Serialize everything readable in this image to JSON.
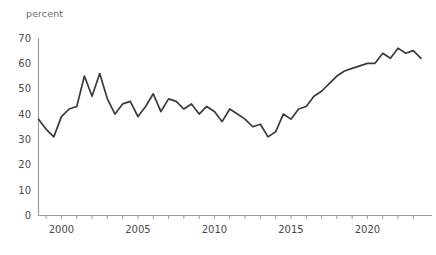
{
  "chart_data": {
    "type": "line",
    "title": "",
    "subtitle": "",
    "xlabel": "",
    "ylabel": "percent",
    "unit_label": "percent",
    "xlim": [
      1998.5,
      1998.5
    ],
    "ylim": [
      0,
      70
    ],
    "grid": false,
    "legend": false,
    "legend_position": "none",
    "line_color": "#3b3b3b",
    "axis_color": "#9a9a9a",
    "tick_label_color": "#4a4a4a",
    "unit_label_color": "#6e6e6e",
    "yticks": [
      0,
      10,
      20,
      30,
      40,
      50,
      60,
      70
    ],
    "ytick_labels": [
      "0",
      "10",
      "20",
      "30",
      "40",
      "50",
      "60",
      "70"
    ],
    "xticks": [
      1999,
      2000,
      2001,
      2002,
      2003,
      2004,
      2005,
      2006,
      2007,
      2008,
      2009,
      2010,
      2011,
      2012,
      2013,
      2014,
      2015,
      2016,
      2017,
      2018,
      2019,
      2020,
      2021,
      2022,
      2023
    ],
    "xtick_labels_shown": [
      "2000",
      "2005",
      "2010",
      "2015",
      "2020"
    ],
    "xtick_labels_shown_at": [
      2000,
      2005,
      2010,
      2015,
      2020
    ],
    "series": [
      {
        "name": "percent",
        "x": [
          1998.5,
          1999.0,
          1999.5,
          2000.0,
          2000.5,
          2001.0,
          2001.5,
          2002.0,
          2002.5,
          2003.0,
          2003.5,
          2004.0,
          2004.5,
          2005.0,
          2005.5,
          2006.0,
          2006.5,
          2007.0,
          2007.5,
          2008.0,
          2008.5,
          2009.0,
          2009.5,
          2010.0,
          2010.5,
          2011.0,
          2011.5,
          2012.0,
          2012.5,
          2013.0,
          2013.5,
          2014.0,
          2014.5,
          2015.0,
          2015.5,
          2016.0,
          2016.5,
          2017.0,
          2017.5,
          2018.0,
          2018.5,
          2019.0,
          2019.5,
          2020.0,
          2020.5,
          2021.0,
          2021.5,
          2022.0,
          2022.5,
          2023.0,
          2023.5
        ],
        "values": [
          38,
          34,
          31,
          39,
          42,
          43,
          55,
          47,
          56,
          46,
          40,
          44,
          45,
          39,
          43,
          48,
          41,
          46,
          45,
          42,
          44,
          40,
          43,
          41,
          37,
          42,
          40,
          38,
          35,
          36,
          31,
          33,
          40,
          38,
          42,
          43,
          47,
          49,
          52,
          55,
          57,
          58,
          59,
          60,
          60,
          64,
          62,
          66,
          64,
          65,
          62
        ]
      }
    ]
  }
}
